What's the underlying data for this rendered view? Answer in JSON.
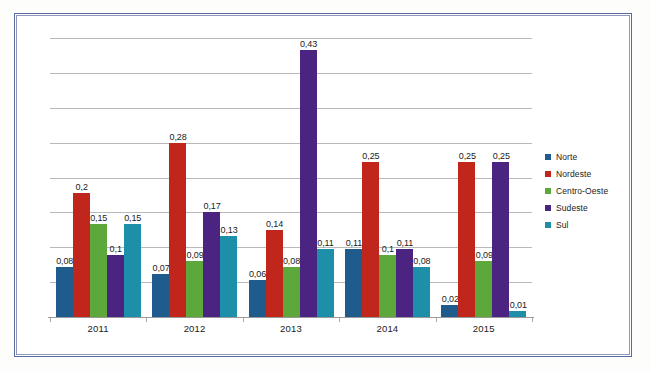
{
  "chart_data": {
    "type": "bar",
    "title": "",
    "subtitle": "",
    "xlabel": "",
    "ylabel": "",
    "categories": [
      "2011",
      "2012",
      "2013",
      "2014",
      "2015"
    ],
    "series": [
      {
        "name": "Norte",
        "color": "#1F5B8C",
        "values": [
          0.08,
          0.07,
          0.06,
          0.11,
          0.02
        ],
        "labels": [
          "0,08",
          "0,07",
          "0,06",
          "0,11",
          "0,02"
        ]
      },
      {
        "name": "Nordeste",
        "color": "#C0261C",
        "values": [
          0.2,
          0.28,
          0.14,
          0.25,
          0.25
        ],
        "labels": [
          "0,2",
          "0,28",
          "0,14",
          "0,25",
          "0,25"
        ]
      },
      {
        "name": "Centro-Oeste",
        "color": "#5CA83A",
        "values": [
          0.15,
          0.09,
          0.08,
          0.1,
          0.09
        ],
        "labels": [
          "0,15",
          "0,09",
          "0,08",
          "0,1",
          "0,09"
        ]
      },
      {
        "name": "Sudeste",
        "color": "#4A2480",
        "values": [
          0.1,
          0.17,
          0.43,
          0.11,
          0.25
        ],
        "labels": [
          "0,1",
          "0,17",
          "0,43",
          "0,11",
          "0,25"
        ]
      },
      {
        "name": "Sul",
        "color": "#1D8FA8",
        "values": [
          0.15,
          0.13,
          0.11,
          0.08,
          0.01
        ],
        "labels": [
          "0,15",
          "0,13",
          "0,11",
          "0,08",
          "0,01"
        ]
      }
    ],
    "ylim": [
      0,
      0.45
    ],
    "ytick_step": 0.05,
    "ytick_labels_visible": false,
    "grid": true,
    "gridline_count": 9,
    "legend_position": "right",
    "data_labels_visible": true
  },
  "frame": {
    "border_color": "#5a6a9e",
    "inner_border_color": "#8d98c2",
    "background": "#ffffff"
  }
}
